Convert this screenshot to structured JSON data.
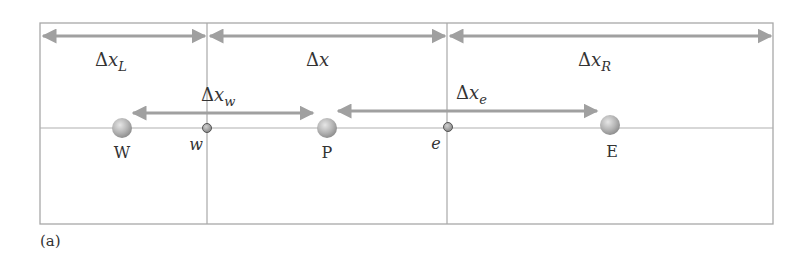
{
  "figure": {
    "caption": "(a)",
    "colors": {
      "frame": "#a8a8a8",
      "arrow": "#a0a0a0",
      "sphere": "#b8b8b8",
      "node": "#8a8a8a",
      "text": "#333333"
    }
  },
  "spacing_labels": {
    "dx_L": {
      "delta": "Δ",
      "x": "x",
      "sub": "L"
    },
    "dx": {
      "delta": "Δ",
      "x": "x"
    },
    "dx_R": {
      "delta": "Δ",
      "x": "x",
      "sub": "R"
    },
    "dx_w": {
      "delta": "Δ",
      "x": "x",
      "sub": "w"
    },
    "dx_e": {
      "delta": "Δ",
      "x": "x",
      "sub": "e"
    }
  },
  "nodes": {
    "W": "W",
    "w": "w",
    "P": "P",
    "e": "e",
    "E": "E"
  }
}
